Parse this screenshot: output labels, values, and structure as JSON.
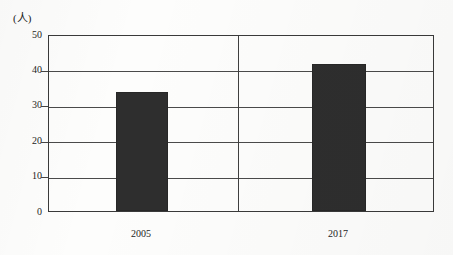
{
  "chart_data": {
    "type": "bar",
    "title": "",
    "xlabel": "",
    "ylabel": "(人)",
    "unit_label": "(人)",
    "categories": [
      "2005",
      "2017"
    ],
    "values": [
      34,
      42
    ],
    "series": [
      {
        "name": "人数",
        "values": [
          34,
          42
        ]
      }
    ],
    "ylim": [
      0,
      50
    ],
    "y_ticks": [
      0,
      10,
      20,
      30,
      40,
      50
    ],
    "y_tick_labels": [
      "0",
      "10",
      "20",
      "30",
      "40",
      "50"
    ],
    "grid": true,
    "legend": false,
    "legend_position": "none",
    "bar_color": "#2e2e2e",
    "axis_color": "#3a3a3a",
    "gridline_color": "#4a4a4a",
    "background_color": "#fdfdfc"
  }
}
